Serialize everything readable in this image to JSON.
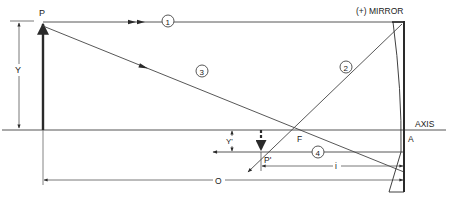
{
  "diagram": {
    "labels": {
      "object_point": "P",
      "image_point": "P'",
      "object_height": "Y",
      "image_height": "Y'",
      "focal_point": "F",
      "vertex": "A",
      "axis": "AXIS",
      "mirror": "(+) MIRROR",
      "object_distance": "O",
      "image_distance": "i"
    },
    "rays": [
      {
        "id": "ray-1",
        "number": "1"
      },
      {
        "id": "ray-2",
        "number": "2"
      },
      {
        "id": "ray-3",
        "number": "3"
      },
      {
        "id": "ray-4",
        "number": "4"
      }
    ],
    "colors": {
      "line": "#2a2a2a",
      "background": "#ffffff"
    }
  }
}
